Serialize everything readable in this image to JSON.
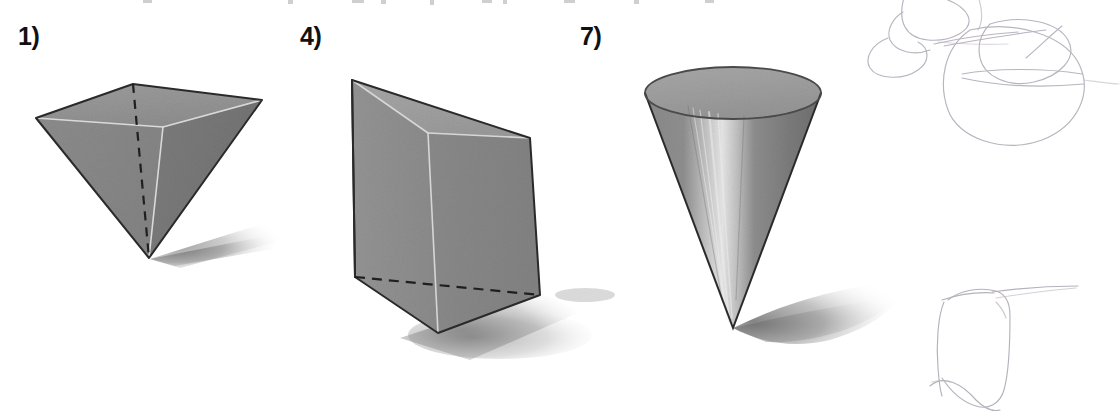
{
  "page": {
    "width": 1120,
    "height": 420,
    "background": "#ffffff",
    "kind": "geometry-worksheet-scan"
  },
  "items": [
    {
      "number": "1)",
      "label_x": 18,
      "label_y": 24,
      "shape_name": "inverted-square-pyramid",
      "shape_title": "Square pyramid (apex pointing down)",
      "has_hidden_edge": true,
      "hidden_edge_style": "dashed",
      "has_shadow": true
    },
    {
      "number": "4)",
      "label_x": 300,
      "label_y": 24,
      "shape_name": "triangular-prism",
      "shape_title": "Upright triangular prism",
      "has_hidden_edge": true,
      "hidden_edge_style": "dashed",
      "has_shadow": true
    },
    {
      "number": "7)",
      "label_x": 580,
      "label_y": 24,
      "shape_name": "inverted-cone",
      "shape_title": "Cone (apex pointing down)",
      "has_hidden_edge": false,
      "hidden_edge_style": "none",
      "has_shadow": true
    }
  ],
  "colors": {
    "page_background": "#ffffff",
    "label_text": "#111111",
    "solid_fill_light": "#a3a3a3",
    "solid_fill_mid": "#8c8c8c",
    "solid_fill_dark": "#757575",
    "solid_fill_darker": "#6b6b6b",
    "outline": "#2b2b2b",
    "highlight_edge": "#d8d8d8",
    "hidden_edge": "#1f1f1f",
    "shadow": "#9a9a9a",
    "pencil_sketch": "#b7b2bd"
  },
  "geometry": {
    "pyramid": {
      "back_top": [
        133,
        84
      ],
      "left": [
        36,
        118
      ],
      "right": [
        262,
        100
      ],
      "front": [
        163,
        127
      ],
      "apex": [
        149,
        258
      ]
    },
    "prism": {
      "top_back_left": [
        352,
        80
      ],
      "top_back_right": [
        530,
        138
      ],
      "top_front": [
        428,
        133
      ],
      "bottom_left": [
        355,
        277
      ],
      "bottom_right": [
        540,
        295
      ],
      "bottom_front": [
        438,
        333
      ]
    },
    "cone": {
      "ellipse_center": [
        733,
        93
      ],
      "ellipse_rx": 88,
      "ellipse_ry": 26,
      "apex": [
        733,
        328
      ]
    }
  },
  "sketches": [
    {
      "name": "pencil-doodle-loops-top-right",
      "x": 870,
      "y": 0,
      "width": 250,
      "height": 200,
      "note": "Faint overlapping pencil ovals / looping scribbles"
    },
    {
      "name": "pencil-doodle-box-bottom-right",
      "x": 930,
      "y": 280,
      "width": 175,
      "height": 135,
      "note": "Faint hand-drawn boxy cube-like outline"
    }
  ],
  "artifacts": {
    "top_edge_clipped_text": "faint clipped descenders from the line of text above, cropped at the top edge"
  }
}
